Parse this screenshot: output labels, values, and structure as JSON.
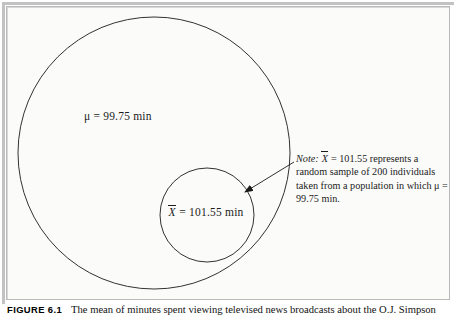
{
  "figure": {
    "caption_tag": "Figure 6.1",
    "caption_text": "The mean of minutes spent viewing televised news broadcasts about the O.J. Simpson",
    "frame_color": "#b9b9b9",
    "background_color": "#fbfbfa",
    "line_color": "#1b1b1b"
  },
  "diagram": {
    "type": "nested-circles-venn",
    "population_circle": {
      "label_symbol": "μ",
      "label_equals": "=",
      "label_value": "99.75",
      "label_units": "min",
      "label_full": "μ = 99.75 min",
      "cx": 154,
      "cy": 153,
      "r": 136
    },
    "sample_circle": {
      "label_symbol": "X",
      "label_equals": "=",
      "label_value": "101.55",
      "label_units": "min",
      "label_full": "X̄ = 101.55 min",
      "cx": 207,
      "cy": 215,
      "r": 48
    },
    "arrow": {
      "from_x": 296,
      "from_y": 163,
      "to_x": 245,
      "to_y": 193,
      "points_to": "sample-circle"
    }
  },
  "note": {
    "prefix": "Note:",
    "symbol": "X",
    "line1_rest": " = 101.55 represents a random",
    "line2": "sample of 200 individuals taken from",
    "line3_before_mu": "a population in which ",
    "line3_mu": "μ",
    "line3_after_mu": " = 99.75 min.",
    "full_text": "Note: X̄ = 101.55 represents a random sample of 200 individuals taken from a population in which μ = 99.75 min."
  }
}
